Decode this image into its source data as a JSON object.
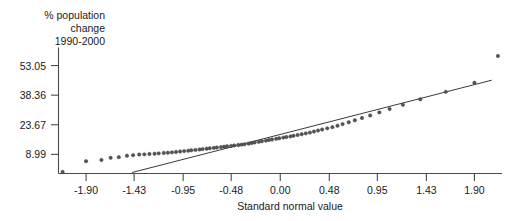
{
  "chart_data": {
    "type": "scatter",
    "title": "",
    "subtitle": "",
    "xlabel": "Standard normal value",
    "ylabel": "% population change 1990-2000",
    "ylabel_lines": [
      "% population",
      "change",
      "1990-2000"
    ],
    "xlim": [
      -2.17,
      2.17
    ],
    "ylim": [
      -0.5,
      62.0
    ],
    "xticks": [
      -1.9,
      -1.43,
      -0.95,
      -0.48,
      0.0,
      0.48,
      0.95,
      1.43,
      1.9
    ],
    "xtick_labels": [
      "-1.90",
      "-1.43",
      "-0.95",
      "-0.48",
      "0.00",
      "0.48",
      "0.95",
      "1.43",
      "1.90"
    ],
    "yticks": [
      8.99,
      23.67,
      38.36,
      53.05
    ],
    "ytick_labels": [
      "8.99",
      "23.67",
      "38.36",
      "53.05"
    ],
    "grid": false,
    "legend": false,
    "marker_color": "#555555",
    "line_color": "#3a3a3a",
    "axis_color": "#4a4a4a",
    "series": [
      {
        "name": "Normal probability plot points",
        "marker": "circle",
        "x": [
          -2.13,
          -1.9,
          -1.75,
          -1.66,
          -1.58,
          -1.5,
          -1.44,
          -1.38,
          -1.33,
          -1.28,
          -1.23,
          -1.19,
          -1.14,
          -1.1,
          -1.06,
          -1.02,
          -0.98,
          -0.94,
          -0.9,
          -0.87,
          -0.83,
          -0.79,
          -0.76,
          -0.72,
          -0.69,
          -0.65,
          -0.62,
          -0.58,
          -0.55,
          -0.52,
          -0.48,
          -0.45,
          -0.41,
          -0.38,
          -0.35,
          -0.31,
          -0.28,
          -0.25,
          -0.21,
          -0.18,
          -0.14,
          -0.11,
          -0.08,
          -0.04,
          -0.01,
          0.03,
          0.06,
          0.1,
          0.13,
          0.17,
          0.21,
          0.25,
          0.29,
          0.33,
          0.37,
          0.41,
          0.46,
          0.51,
          0.56,
          0.61,
          0.67,
          0.73,
          0.8,
          0.88,
          0.97,
          1.07,
          1.2,
          1.37,
          1.62,
          1.9,
          2.13
        ],
        "y": [
          0.3,
          5.6,
          6.2,
          7.3,
          7.6,
          8.3,
          8.6,
          8.9,
          9.0,
          9.2,
          9.3,
          9.5,
          9.7,
          9.8,
          10.0,
          10.2,
          10.4,
          10.6,
          10.8,
          11.0,
          11.2,
          11.4,
          11.6,
          11.8,
          12.0,
          12.2,
          12.4,
          12.6,
          12.8,
          13.0,
          13.2,
          13.4,
          13.6,
          13.8,
          14.0,
          14.3,
          14.6,
          14.9,
          15.2,
          15.5,
          15.8,
          16.1,
          16.4,
          16.7,
          17.0,
          17.3,
          17.6,
          17.9,
          18.2,
          18.6,
          19.0,
          19.4,
          19.8,
          20.3,
          20.8,
          21.3,
          21.9,
          22.5,
          23.2,
          24.0,
          24.9,
          25.9,
          27.0,
          28.3,
          29.8,
          31.5,
          33.6,
          36.3,
          40.0,
          44.5,
          57.8
        ],
        "outliers": [
          {
            "x": 2.13,
            "y": 57.8,
            "label": "high outlier"
          }
        ]
      }
    ],
    "reference_line": {
      "name": "fitted normal reference line",
      "x_start": -1.45,
      "y_start": 0.0,
      "x_end": 2.07,
      "y_end": 45.8
    }
  }
}
